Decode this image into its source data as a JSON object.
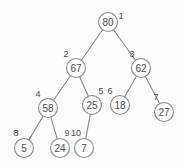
{
  "figure": {
    "name": "binary-tree-diagram",
    "background_color": "#fdfdfd",
    "stroke_color": "#8a8a8a",
    "text_color": "#4a4a4a",
    "width": 184,
    "height": 168
  },
  "chart_data": {
    "type": "diagram",
    "subtype": "binary-tree",
    "title": "",
    "nodes": [
      {
        "index": "1",
        "value": "80",
        "x": 108,
        "y": 22,
        "label_x": 121,
        "label_y": 16,
        "parent": null
      },
      {
        "index": "2",
        "value": "67",
        "x": 76,
        "y": 68,
        "label_x": 66,
        "label_y": 54,
        "parent": "1"
      },
      {
        "index": "3",
        "value": "62",
        "x": 141,
        "y": 68,
        "label_x": 132,
        "label_y": 54,
        "parent": "1"
      },
      {
        "index": "4",
        "value": "58",
        "x": 48,
        "y": 108,
        "label_x": 38,
        "label_y": 94,
        "parent": "2"
      },
      {
        "index": "5",
        "value": "25",
        "x": 92,
        "y": 105,
        "label_x": 101,
        "label_y": 91,
        "parent": "2"
      },
      {
        "index": "6",
        "value": "18",
        "x": 120,
        "y": 105,
        "label_x": 110,
        "label_y": 91,
        "parent": "3"
      },
      {
        "index": "7",
        "value": "27",
        "x": 164,
        "y": 112,
        "label_x": 156,
        "label_y": 97,
        "parent": "3"
      },
      {
        "index": "8",
        "value": "5",
        "x": 24,
        "y": 148,
        "label_x": 16,
        "label_y": 133,
        "parent": "4"
      },
      {
        "index": "9",
        "value": "24",
        "x": 60,
        "y": 148,
        "label_x": 67,
        "label_y": 133,
        "parent": "4"
      },
      {
        "index": "10",
        "value": "7",
        "x": 84,
        "y": 148,
        "label_x": 76,
        "label_y": 133,
        "parent": "5"
      }
    ],
    "edges": [
      {
        "from": "1",
        "to": "2"
      },
      {
        "from": "1",
        "to": "3"
      },
      {
        "from": "2",
        "to": "4"
      },
      {
        "from": "2",
        "to": "5"
      },
      {
        "from": "3",
        "to": "6"
      },
      {
        "from": "3",
        "to": "7"
      },
      {
        "from": "4",
        "to": "8"
      },
      {
        "from": "4",
        "to": "9"
      },
      {
        "from": "5",
        "to": "10"
      }
    ],
    "node_radius": 9.5,
    "values": [
      "80",
      "67",
      "62",
      "58",
      "25",
      "18",
      "27",
      "5",
      "24",
      "7"
    ],
    "indices": [
      "1",
      "2",
      "3",
      "4",
      "5",
      "6",
      "7",
      "8",
      "9",
      "10"
    ]
  }
}
